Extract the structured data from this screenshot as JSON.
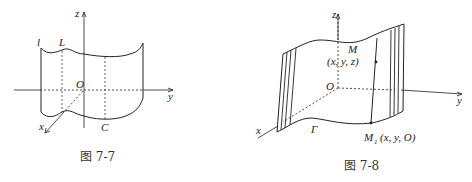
{
  "figures": [
    {
      "caption": "图 7-7",
      "labels": {
        "z": "z",
        "y": "y",
        "x": "x",
        "origin": "O",
        "l": "l",
        "L": "L",
        "C": "C"
      }
    },
    {
      "caption": "图 7-8",
      "labels": {
        "z": "z",
        "y": "y",
        "x": "x",
        "origin": "O",
        "M": "M",
        "M_coords": "(x, y, z)",
        "M1": "M",
        "M1_sub": "1",
        "M1_coords": "(x, y, O)",
        "Gamma": "Γ"
      }
    }
  ]
}
